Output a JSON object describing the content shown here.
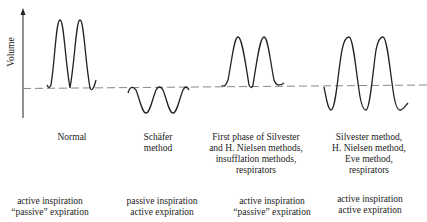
{
  "diagram": {
    "y_axis_label": "Volume",
    "panels": [
      {
        "name": "Normal",
        "method_label": "Normal",
        "mode_line1": "active inspiration",
        "mode_line2": "“passive” expiration"
      },
      {
        "name": "Schafer",
        "method_label_line1": "Schäfer",
        "method_label_line2": "method",
        "mode_line1": "passive inspiration",
        "mode_line2": "active expiration"
      },
      {
        "name": "First phase",
        "method_label_line1": "First phase of Silvester",
        "method_label_line2": "and H. Nielsen methods,",
        "method_label_line3": "insufflation methods,",
        "method_label_line4": "respirators",
        "mode_line1": "active inspiration",
        "mode_line2": "“passive” expiration"
      },
      {
        "name": "Silvester",
        "method_label_line1": "Silvester method,",
        "method_label_line2": "H. Nielsen method,",
        "method_label_line3": "Eve method,",
        "method_label_line4": "respirators",
        "mode_line1": "active inspiration",
        "mode_line2": "active expiration"
      }
    ]
  }
}
